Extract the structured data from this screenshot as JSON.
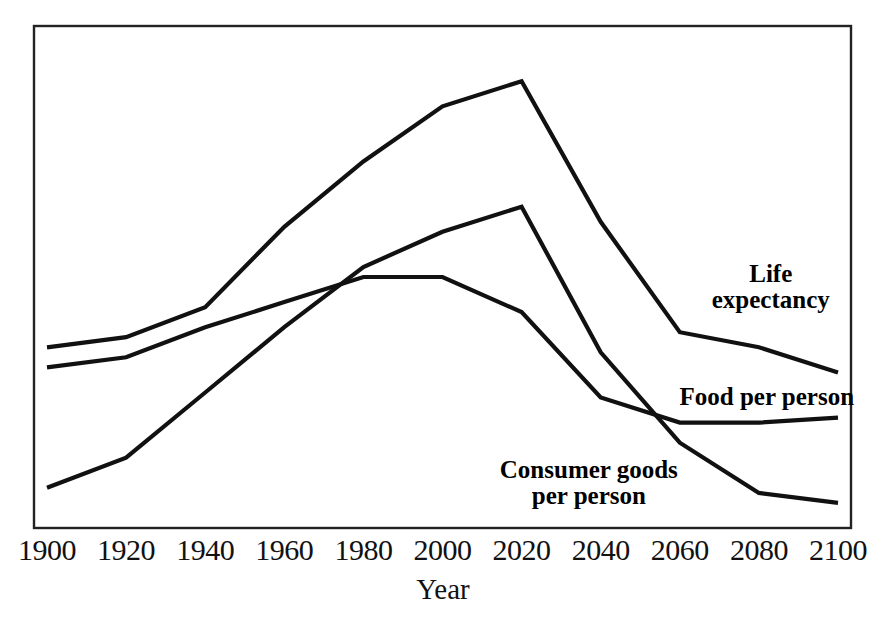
{
  "chart_data": {
    "type": "line",
    "title": "",
    "subtitle": "",
    "xlabel": "Year",
    "ylabel": "",
    "grid": false,
    "legend_position": "inline-annotations",
    "frame": {
      "x0": 34,
      "y0": 26,
      "x1": 851,
      "y1": 528
    },
    "xlim": [
      1900,
      2100
    ],
    "ylim": [
      0,
      100
    ],
    "x": [
      1900,
      1920,
      1940,
      1960,
      1980,
      2000,
      2020,
      2040,
      2060,
      2080,
      2100
    ],
    "tick_labels": [
      "1900",
      "1920",
      "1940",
      "1960",
      "1980",
      "2000",
      "2020",
      "2040",
      "2060",
      "2080",
      "2100"
    ],
    "series": [
      {
        "name": "Life expectancy",
        "label_lines": [
          "Life",
          "expectancy"
        ],
        "label_x": 2083,
        "label_y": 48,
        "color": "#111111",
        "values": [
          36,
          38,
          44,
          60,
          73,
          84,
          89,
          61,
          39,
          36,
          31
        ]
      },
      {
        "name": "Food per person",
        "label_lines": [
          "Food per person"
        ],
        "label_x": 2082,
        "label_y": 26,
        "color": "#111111",
        "values": [
          32,
          34,
          40,
          45,
          50,
          50,
          43,
          26,
          21,
          21,
          22
        ]
      },
      {
        "name": "Consumer goods per person",
        "label_lines": [
          "Consumer goods",
          "per person"
        ],
        "label_x": 2037,
        "label_y": 9,
        "color": "#111111",
        "values": [
          8,
          14,
          27,
          40,
          52,
          59,
          64,
          35,
          17,
          7,
          5
        ]
      }
    ],
    "annotations": [
      {
        "text": "Life expectancy",
        "kind": "series-label"
      },
      {
        "text": "Food per person",
        "kind": "series-label"
      },
      {
        "text": "Consumer goods per person",
        "kind": "series-label"
      }
    ]
  },
  "colors": {
    "line": "#111111",
    "frame": "#222222",
    "background": "#ffffff",
    "text": "#111111"
  }
}
